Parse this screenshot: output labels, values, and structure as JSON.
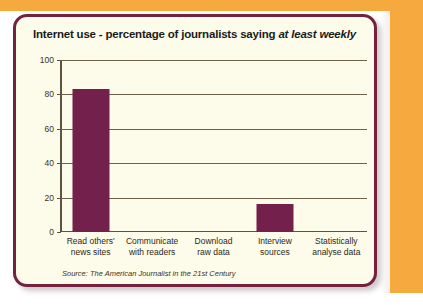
{
  "frame": {
    "accent_color": "#f6a93f",
    "card_background": "#fdfbe9",
    "card_border_color": "#74233f",
    "bar_color": "#74204d",
    "axis_color": "#5c5340"
  },
  "chart_data": {
    "type": "bar",
    "title": "Internet use - percentage of journalists saying ",
    "title_emphasis": "at least weekly",
    "categories": [
      "Read others' news sites",
      "Communicate with readers",
      "Download raw data",
      "Interview sources",
      "Statistically analyse data"
    ],
    "category_lines": [
      [
        "Read others'",
        "news sites"
      ],
      [
        "Communicate",
        "with readers"
      ],
      [
        "Download",
        "raw data"
      ],
      [
        "Interview",
        "sources"
      ],
      [
        "Statistically",
        "analyse data"
      ]
    ],
    "values": [
      83,
      0,
      0,
      16,
      0
    ],
    "xlabel": "",
    "ylabel": "",
    "ylim": [
      0,
      100
    ],
    "yticks": [
      0,
      20,
      40,
      60,
      80,
      100
    ],
    "ytick_labels": [
      "0",
      "20",
      "40",
      "60",
      "80",
      "100"
    ],
    "grid": true,
    "legend": false,
    "source": "Source: The American Journalist in the 21st Century"
  }
}
